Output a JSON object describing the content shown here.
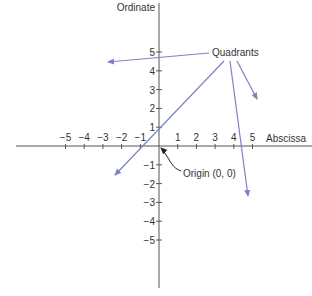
{
  "diagram": {
    "colors": {
      "axis": "#555555",
      "text": "#333333",
      "quadrant_arrow": "#7b82c4",
      "origin_arrow": "#222222",
      "background": "#ffffff"
    },
    "axes": {
      "x_label": "Abscissa",
      "y_label": "Ordinate",
      "x_ticks": [
        "−5",
        "−4",
        "−3",
        "−2",
        "−1",
        "1",
        "2",
        "3",
        "4",
        "5"
      ],
      "x_tick_values": [
        -5,
        -4,
        -3,
        -2,
        -1,
        1,
        2,
        3,
        4,
        5
      ],
      "y_ticks": [
        "5",
        "4",
        "3",
        "2",
        "1",
        "−1",
        "−2",
        "−3",
        "−4",
        "−5"
      ],
      "y_tick_values": [
        5,
        4,
        3,
        2,
        1,
        -1,
        -2,
        -3,
        -4,
        -5
      ]
    },
    "callouts": {
      "quadrants_label": "Quadrants",
      "origin_label": "Origin (0, 0)"
    },
    "quadrant_arrows": [
      {
        "target": "Quadrant I",
        "from": [
          237,
          61
        ],
        "to": [
          257,
          99
        ]
      },
      {
        "target": "Quadrant II",
        "from": [
          209,
          53
        ],
        "to": [
          108,
          62
        ]
      },
      {
        "target": "Quadrant III",
        "from": [
          224,
          61
        ],
        "to": [
          115,
          175
        ]
      },
      {
        "target": "Quadrant IV",
        "from": [
          230,
          61
        ],
        "to": [
          248,
          196
        ]
      }
    ]
  }
}
